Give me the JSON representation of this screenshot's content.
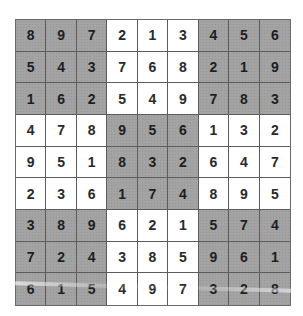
{
  "puzzle": {
    "type": "sudoku",
    "grid": [
      [
        8,
        9,
        7,
        2,
        1,
        3,
        4,
        5,
        6
      ],
      [
        5,
        4,
        3,
        7,
        6,
        8,
        2,
        1,
        9
      ],
      [
        1,
        6,
        2,
        5,
        4,
        9,
        7,
        8,
        3
      ],
      [
        4,
        7,
        8,
        9,
        5,
        6,
        1,
        3,
        2
      ],
      [
        9,
        5,
        1,
        8,
        3,
        2,
        6,
        4,
        7
      ],
      [
        2,
        3,
        6,
        1,
        7,
        4,
        8,
        9,
        5
      ],
      [
        3,
        8,
        9,
        6,
        2,
        1,
        5,
        7,
        4
      ],
      [
        7,
        2,
        4,
        3,
        8,
        5,
        9,
        6,
        1
      ],
      [
        6,
        1,
        5,
        4,
        9,
        7,
        3,
        2,
        8
      ]
    ],
    "shaded_boxes": [
      [
        0,
        0
      ],
      [
        0,
        2
      ],
      [
        1,
        1
      ],
      [
        2,
        0
      ],
      [
        2,
        2
      ]
    ],
    "colors": {
      "shaded": "#a3a3a3",
      "plain": "#ffffff",
      "grid_line": "#5c5c5c",
      "digit": "#2a2a2a"
    }
  }
}
